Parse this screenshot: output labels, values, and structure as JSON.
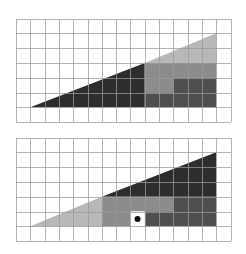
{
  "diagram": {
    "title": "",
    "type": "missing-square-puzzle",
    "colors": {
      "background": "#ffffff",
      "grid": "#9a9a9a",
      "light": "#b8b8b8",
      "medium": "#8c8c8c",
      "dark": "#4f4f4f",
      "darkest": "#2d2d2d",
      "hole": "#ffffff",
      "dot": "#111111"
    },
    "panels": [
      {
        "name": "top-arrangement",
        "grid": {
          "cols": 15,
          "rows": 7
        },
        "shapes": [
          {
            "name": "darkest-triangle",
            "color": "darkest",
            "points": [
              [
                1,
                6
              ],
              [
                9,
                3
              ],
              [
                9,
                6
              ]
            ]
          },
          {
            "name": "light-triangle",
            "color": "light",
            "points": [
              [
                9,
                3
              ],
              [
                14,
                1
              ],
              [
                14,
                3
              ]
            ]
          },
          {
            "name": "medium-l-shape",
            "color": "medium",
            "points": [
              [
                9,
                3
              ],
              [
                14,
                3
              ],
              [
                14,
                4
              ],
              [
                11,
                4
              ],
              [
                11,
                5
              ],
              [
                9,
                5
              ]
            ]
          },
          {
            "name": "dark-l-shape",
            "color": "dark",
            "points": [
              [
                11,
                4
              ],
              [
                14,
                4
              ],
              [
                14,
                6
              ],
              [
                9,
                6
              ],
              [
                9,
                5
              ],
              [
                11,
                5
              ]
            ]
          }
        ],
        "hole": null
      },
      {
        "name": "bottom-arrangement",
        "grid": {
          "cols": 15,
          "rows": 7
        },
        "shapes": [
          {
            "name": "light-triangle",
            "color": "light",
            "points": [
              [
                1,
                6
              ],
              [
                6,
                4
              ],
              [
                6,
                6
              ]
            ]
          },
          {
            "name": "darkest-triangle",
            "color": "darkest",
            "points": [
              [
                6,
                4
              ],
              [
                14,
                1
              ],
              [
                14,
                4
              ]
            ]
          },
          {
            "name": "medium-l-shape",
            "color": "medium",
            "points": [
              [
                6,
                4
              ],
              [
                11,
                4
              ],
              [
                11,
                5
              ],
              [
                8,
                5
              ],
              [
                8,
                6
              ],
              [
                6,
                6
              ]
            ]
          },
          {
            "name": "dark-l-shape",
            "color": "dark",
            "points": [
              [
                11,
                4
              ],
              [
                14,
                4
              ],
              [
                14,
                6
              ],
              [
                9,
                6
              ],
              [
                9,
                5
              ],
              [
                11,
                5
              ]
            ]
          }
        ],
        "hole": {
          "col": 8,
          "row": 5,
          "marker": "dot"
        }
      }
    ]
  }
}
